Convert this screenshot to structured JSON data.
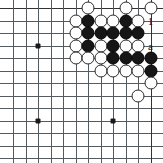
{
  "diagram": {
    "kind": "go-board-problem",
    "board": {
      "origin_x": 13,
      "origin_y": 8,
      "spacing": 12.5,
      "cols": 12,
      "rows": 13,
      "line_color": "#555a5e",
      "edge_color": "#2f3336",
      "background": "#ffffff"
    },
    "star_points": [
      {
        "col": 2,
        "row": 3
      },
      {
        "col": 2,
        "row": 9
      },
      {
        "col": 8,
        "row": 9
      }
    ],
    "stones": [
      {
        "col": 6,
        "row": 0,
        "color": "white"
      },
      {
        "col": 9,
        "row": 0,
        "color": "white"
      },
      {
        "col": 11,
        "row": 0,
        "color": "white"
      },
      {
        "col": 5,
        "row": 1,
        "color": "white"
      },
      {
        "col": 6,
        "row": 1,
        "color": "black"
      },
      {
        "col": 7,
        "row": 1,
        "color": "white"
      },
      {
        "col": 8,
        "row": 1,
        "color": "white"
      },
      {
        "col": 9,
        "row": 1,
        "color": "black"
      },
      {
        "col": 10,
        "row": 1,
        "color": "white"
      },
      {
        "col": 5,
        "row": 2,
        "color": "white"
      },
      {
        "col": 6,
        "row": 2,
        "color": "black"
      },
      {
        "col": 7,
        "row": 2,
        "color": "black"
      },
      {
        "col": 8,
        "row": 2,
        "color": "black"
      },
      {
        "col": 9,
        "row": 2,
        "color": "black"
      },
      {
        "col": 10,
        "row": 2,
        "color": "black"
      },
      {
        "col": 5,
        "row": 3,
        "color": "white"
      },
      {
        "col": 6,
        "row": 3,
        "color": "black"
      },
      {
        "col": 7,
        "row": 3,
        "color": "white"
      },
      {
        "col": 8,
        "row": 3,
        "color": "black"
      },
      {
        "col": 9,
        "row": 3,
        "color": "white"
      },
      {
        "col": 10,
        "row": 3,
        "color": "white"
      },
      {
        "col": 5,
        "row": 4,
        "color": "white"
      },
      {
        "col": 6,
        "row": 4,
        "color": "white"
      },
      {
        "col": 7,
        "row": 4,
        "color": "white"
      },
      {
        "col": 8,
        "row": 4,
        "color": "black"
      },
      {
        "col": 9,
        "row": 4,
        "color": "black"
      },
      {
        "col": 10,
        "row": 4,
        "color": "black"
      },
      {
        "col": 11,
        "row": 4,
        "color": "black"
      },
      {
        "col": 7,
        "row": 5,
        "color": "white"
      },
      {
        "col": 8,
        "row": 5,
        "color": "white"
      },
      {
        "col": 9,
        "row": 5,
        "color": "white"
      },
      {
        "col": 10,
        "row": 5,
        "color": "white"
      },
      {
        "col": 11,
        "row": 5,
        "color": "black"
      },
      {
        "col": 11,
        "row": 6,
        "color": "white"
      },
      {
        "col": 10,
        "row": 7,
        "color": "white"
      }
    ],
    "move_labels": [
      {
        "text": "1",
        "col": 11,
        "row": 1,
        "name": "move-label-1"
      },
      {
        "text": "a",
        "col": 11,
        "row": 3,
        "name": "point-label-a"
      }
    ]
  }
}
